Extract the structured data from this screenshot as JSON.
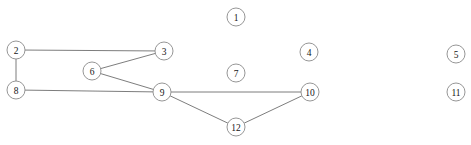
{
  "diagram": {
    "width": 471,
    "height": 145,
    "background_color": "#ffffff",
    "node_fill_color": "#ffffff",
    "node_stroke_color": "#8a8a8a",
    "edge_color": "#6e6e6e",
    "label_color": "#151515",
    "node_radius": 9,
    "nodes": [
      {
        "id": "1",
        "label": "1",
        "x": 236,
        "y": 17
      },
      {
        "id": "2",
        "label": "2",
        "x": 16,
        "y": 50
      },
      {
        "id": "3",
        "label": "3",
        "x": 164,
        "y": 51
      },
      {
        "id": "4",
        "label": "4",
        "x": 309,
        "y": 52
      },
      {
        "id": "5",
        "label": "5",
        "x": 456,
        "y": 54
      },
      {
        "id": "6",
        "label": "6",
        "x": 92,
        "y": 71
      },
      {
        "id": "7",
        "label": "7",
        "x": 236,
        "y": 73
      },
      {
        "id": "8",
        "label": "8",
        "x": 16,
        "y": 90
      },
      {
        "id": "9",
        "label": "9",
        "x": 162,
        "y": 92
      },
      {
        "id": "10",
        "label": "10",
        "x": 310,
        "y": 92
      },
      {
        "id": "11",
        "label": "11",
        "x": 456,
        "y": 92
      },
      {
        "id": "12",
        "label": "12",
        "x": 236,
        "y": 127
      }
    ],
    "edges": [
      {
        "source": "2",
        "target": "3"
      },
      {
        "source": "2",
        "target": "8"
      },
      {
        "source": "8",
        "target": "9"
      },
      {
        "source": "6",
        "target": "3"
      },
      {
        "source": "6",
        "target": "9"
      },
      {
        "source": "9",
        "target": "10"
      },
      {
        "source": "9",
        "target": "12"
      },
      {
        "source": "12",
        "target": "10"
      }
    ],
    "isolated_nodes": [
      "1",
      "4",
      "5",
      "7",
      "11"
    ]
  }
}
